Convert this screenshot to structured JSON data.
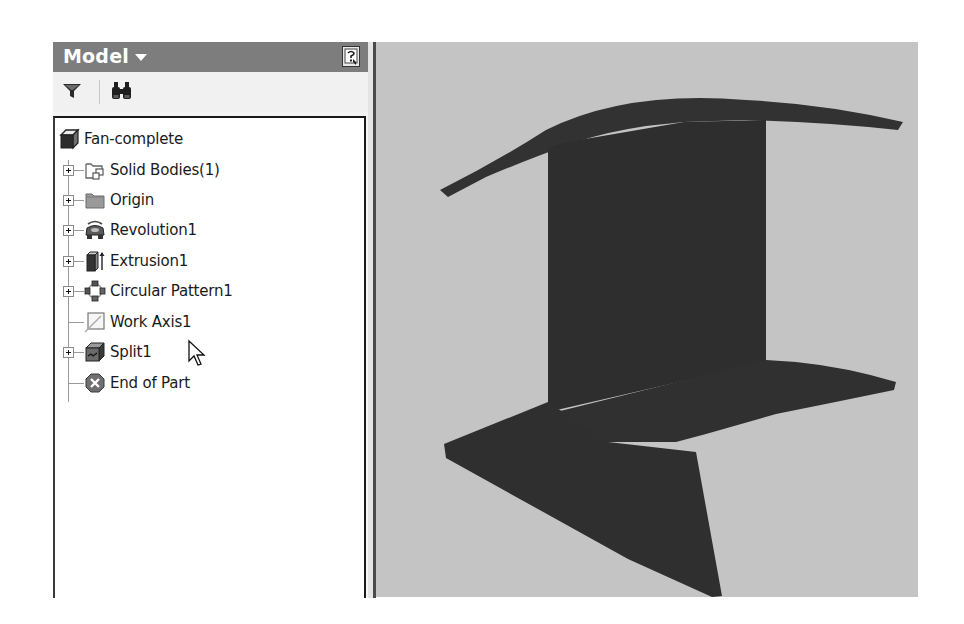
{
  "browser": {
    "title": "Model",
    "title_icon": "dropdown-caret-icon",
    "help_icon": "help-icon",
    "toolbar": {
      "filter_icon": "filter-icon",
      "find_icon": "binoculars-icon"
    },
    "tree": {
      "root": {
        "label": "Fan-complete",
        "icon": "part-icon"
      },
      "items": [
        {
          "label": "Solid Bodies(1)",
          "icon": "solid-bodies-folder-icon",
          "expandable": true
        },
        {
          "label": "Origin",
          "icon": "origin-folder-icon",
          "expandable": true
        },
        {
          "label": "Revolution1",
          "icon": "revolution-icon",
          "expandable": true
        },
        {
          "label": "Extrusion1",
          "icon": "extrusion-icon",
          "expandable": true
        },
        {
          "label": "Circular Pattern1",
          "icon": "circular-pattern-icon",
          "expandable": true
        },
        {
          "label": "Work Axis1",
          "icon": "work-axis-icon",
          "expandable": false
        },
        {
          "label": "Split1",
          "icon": "split-icon",
          "expandable": true
        },
        {
          "label": "End of Part",
          "icon": "end-of-part-icon",
          "expandable": false
        }
      ]
    }
  },
  "viewport": {
    "background": "#c4c4c4",
    "model_color": "#333333",
    "model_name": "fan-blade-segment"
  },
  "colors": {
    "header_bg": "#7d7d7d",
    "tree_bg": "#ffffff"
  }
}
